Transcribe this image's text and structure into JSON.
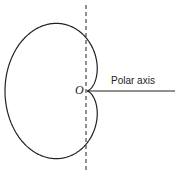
{
  "diagram": {
    "type": "cardioid",
    "origin_label": "O",
    "axis_label": "Polar axis",
    "colors": {
      "stroke": "#222222",
      "background": "#ffffff"
    }
  }
}
